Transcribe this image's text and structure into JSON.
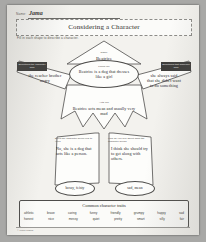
{
  "document": {
    "type": "worksheet-scan",
    "title": "Considering a Character",
    "subtitle": "Fill in each shape to describe a character.",
    "footer": "© Learn Makes"
  },
  "name_row": {
    "label": "Name:",
    "value": "Jama"
  },
  "figure": {
    "hat": {
      "tag": "Name",
      "answer": "Beatrice"
    },
    "head": {
      "tag": "Looks like",
      "answer": "Beatrice is a dog that dresses like a girl"
    },
    "arm_left": {
      "tag": "Something the character said",
      "answer": "the reacher brother angry"
    },
    "arm_right": {
      "tag": "Something that someone said",
      "answer": "she always said that she didn't want to do something"
    },
    "torso": {
      "tag": "Acts like",
      "answer": "Beatrice acts mean and usually very mad"
    },
    "leg_left": {
      "tag": "Does the character seem real to you?",
      "answer": "No, she is a dog that acts like a person."
    },
    "leg_right": {
      "tag": "How do you feel about what the character does?",
      "answer": "I think she should try to get along with others."
    },
    "foot_left": {
      "answer": "bossy, feisty"
    },
    "foot_right": {
      "answer": "sad, mean"
    }
  },
  "word_bank": {
    "title": "Common character traits",
    "row1": [
      "athletic",
      "brave",
      "caring",
      "funny",
      "friendly",
      "grumpy",
      "happy",
      "sad"
    ],
    "row2": [
      "honest",
      "nice",
      "messy",
      "quiet",
      "pretty",
      "smart",
      "silly",
      "fair"
    ]
  }
}
